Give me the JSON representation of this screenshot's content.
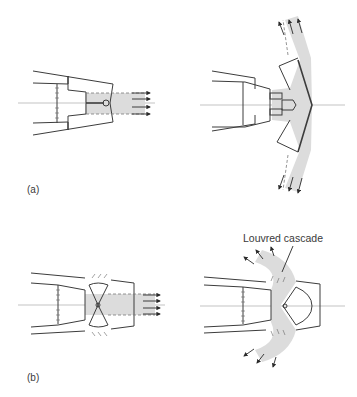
{
  "figure": {
    "panels": [
      {
        "id": "a",
        "label": "(a)",
        "states": [
          "forward-thrust",
          "reverse-thrust-clamshell"
        ]
      },
      {
        "id": "b",
        "label": "(b)",
        "states": [
          "forward-thrust",
          "reverse-thrust-cascade"
        ]
      }
    ],
    "callouts": {
      "louvred_cascade": "Louvred cascade"
    },
    "colors": {
      "line": "#3c3c3c",
      "flow_fill": "#dcdcdc",
      "axis": "#9a9a9a",
      "background": "#ffffff"
    }
  }
}
